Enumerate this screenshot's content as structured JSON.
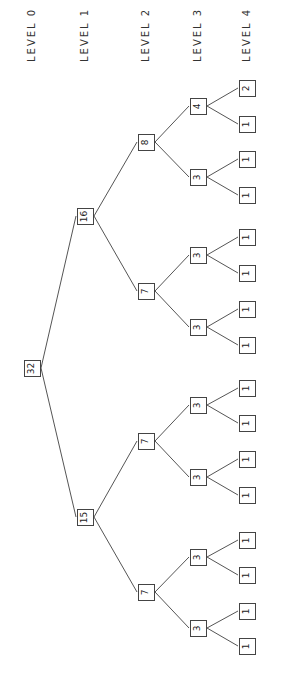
{
  "diagram": {
    "levels": [
      {
        "label": "LEVEL 0",
        "x": 32
      },
      {
        "label": "LEVEL 1",
        "x": 85
      },
      {
        "label": "LEVEL 2",
        "x": 146
      },
      {
        "label": "LEVEL 3",
        "x": 198
      },
      {
        "label": "LEVEL 4",
        "x": 247
      }
    ],
    "nodes": [
      {
        "id": "n0",
        "value": "32",
        "level": 0,
        "y": 368
      },
      {
        "id": "n1a",
        "value": "16",
        "level": 1,
        "y": 216,
        "parent": "n0"
      },
      {
        "id": "n1b",
        "value": "15",
        "level": 1,
        "y": 517,
        "parent": "n0"
      },
      {
        "id": "n2a",
        "value": "8",
        "level": 2,
        "y": 142,
        "parent": "n1a"
      },
      {
        "id": "n2b",
        "value": "7",
        "level": 2,
        "y": 291,
        "parent": "n1a"
      },
      {
        "id": "n2c",
        "value": "7",
        "level": 2,
        "y": 441,
        "parent": "n1b"
      },
      {
        "id": "n2d",
        "value": "7",
        "level": 2,
        "y": 592,
        "parent": "n1b"
      },
      {
        "id": "n3a",
        "value": "4",
        "level": 3,
        "y": 106,
        "parent": "n2a"
      },
      {
        "id": "n3b",
        "value": "3",
        "level": 3,
        "y": 177,
        "parent": "n2a"
      },
      {
        "id": "n3c",
        "value": "3",
        "level": 3,
        "y": 255,
        "parent": "n2b"
      },
      {
        "id": "n3d",
        "value": "3",
        "level": 3,
        "y": 327,
        "parent": "n2b"
      },
      {
        "id": "n3e",
        "value": "3",
        "level": 3,
        "y": 405,
        "parent": "n2c"
      },
      {
        "id": "n3f",
        "value": "3",
        "level": 3,
        "y": 477,
        "parent": "n2c"
      },
      {
        "id": "n3g",
        "value": "3",
        "level": 3,
        "y": 557,
        "parent": "n2d"
      },
      {
        "id": "n3h",
        "value": "3",
        "level": 3,
        "y": 628,
        "parent": "n2d"
      },
      {
        "id": "l1",
        "value": "2",
        "level": 4,
        "y": 88,
        "parent": "n3a"
      },
      {
        "id": "l2",
        "value": "1",
        "level": 4,
        "y": 124,
        "parent": "n3a"
      },
      {
        "id": "l3",
        "value": "1",
        "level": 4,
        "y": 159,
        "parent": "n3b"
      },
      {
        "id": "l4",
        "value": "1",
        "level": 4,
        "y": 195,
        "parent": "n3b"
      },
      {
        "id": "l5",
        "value": "1",
        "level": 4,
        "y": 237,
        "parent": "n3c"
      },
      {
        "id": "l6",
        "value": "1",
        "level": 4,
        "y": 273,
        "parent": "n3c"
      },
      {
        "id": "l7",
        "value": "1",
        "level": 4,
        "y": 309,
        "parent": "n3d"
      },
      {
        "id": "l8",
        "value": "1",
        "level": 4,
        "y": 345,
        "parent": "n3d"
      },
      {
        "id": "l9",
        "value": "1",
        "level": 4,
        "y": 388,
        "parent": "n3e"
      },
      {
        "id": "l10",
        "value": "1",
        "level": 4,
        "y": 423,
        "parent": "n3e"
      },
      {
        "id": "l11",
        "value": "1",
        "level": 4,
        "y": 459,
        "parent": "n3f"
      },
      {
        "id": "l12",
        "value": "1",
        "level": 4,
        "y": 495,
        "parent": "n3f"
      },
      {
        "id": "l13",
        "value": "1",
        "level": 4,
        "y": 540,
        "parent": "n3g"
      },
      {
        "id": "l14",
        "value": "1",
        "level": 4,
        "y": 575,
        "parent": "n3g"
      },
      {
        "id": "l15",
        "value": "1",
        "level": 4,
        "y": 611,
        "parent": "n3h"
      },
      {
        "id": "l16",
        "value": "1",
        "level": 4,
        "y": 646,
        "parent": "n3h"
      }
    ]
  }
}
